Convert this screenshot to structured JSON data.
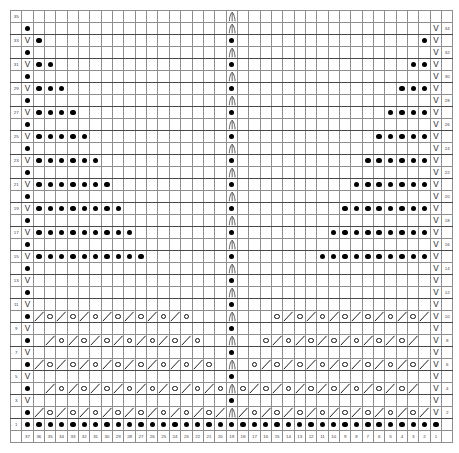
{
  "chart": {
    "kind": "knitting-stitch-chart",
    "columns": 37,
    "rows": 35,
    "cell_px": 11.35,
    "colors": {
      "grid_line": "#8e8e8e",
      "major_line": "#4a4a4a",
      "label_bg": "#dcdcdc",
      "no_stitch_bg": "#d2d2d2",
      "cell_bg": "#ffffff",
      "symbol": "#000000"
    },
    "symbols": {
      "purl": "●",
      "slip": "V",
      "yarnover": "O",
      "decrease": "╱",
      "double_decrease": "∧"
    },
    "column_numbers": [
      37,
      36,
      35,
      34,
      33,
      32,
      31,
      30,
      29,
      28,
      27,
      26,
      25,
      24,
      23,
      22,
      21,
      20,
      19,
      18,
      17,
      16,
      15,
      14,
      13,
      12,
      11,
      10,
      9,
      8,
      7,
      6,
      5,
      4,
      3,
      2,
      1
    ],
    "left_row_numbers": [
      35,
      "",
      33,
      "",
      31,
      "",
      29,
      "",
      27,
      "",
      25,
      "",
      23,
      "",
      21,
      "",
      19,
      "",
      17,
      "",
      15,
      "",
      13,
      "",
      11,
      "",
      9,
      "",
      7,
      "",
      5,
      "",
      3,
      "",
      1
    ],
    "right_row_numbers": [
      "",
      34,
      "",
      32,
      "",
      30,
      "",
      28,
      "",
      26,
      "",
      24,
      "",
      22,
      "",
      20,
      "",
      18,
      "",
      16,
      "",
      14,
      "",
      12,
      "",
      10,
      "",
      8,
      "",
      6,
      "",
      4,
      "",
      2,
      ""
    ],
    "center_column": 19,
    "rows_data": [
      {
        "n": 35,
        "left": "35",
        "right": "",
        "cells": "..................A..................",
        "ns_left": 0,
        "ns_right": 0
      },
      {
        "n": 34,
        "left": "",
        "right": "34",
        "cells": "_P................A................V_",
        "ns_left": 0,
        "ns_right": 0
      },
      {
        "n": 33,
        "left": "33",
        "right": "",
        "cells": "_VP...............P...............PV_",
        "ns_left": 0,
        "ns_right": 0
      },
      {
        "n": 32,
        "left": "",
        "right": "32",
        "cells": "_P................A................V_",
        "ns_left": 0,
        "ns_right": 0
      },
      {
        "n": 31,
        "left": "31",
        "right": "",
        "cells": "_VPP..............P..............PPV_",
        "ns_left": 0,
        "ns_right": 0
      },
      {
        "n": 30,
        "left": "",
        "right": "30",
        "cells": "_P................A................V_",
        "ns_left": 0,
        "ns_right": 0
      },
      {
        "n": 29,
        "left": "29",
        "right": "",
        "cells": "_VPPP.............P.............PPPV_",
        "ns_left": 0,
        "ns_right": 0
      },
      {
        "n": 28,
        "left": "",
        "right": "28",
        "cells": "_P................A................V_",
        "ns_left": 0,
        "ns_right": 0
      },
      {
        "n": 27,
        "left": "27",
        "right": "",
        "cells": "_VPPPP............P............PPPPV_",
        "ns_left": 0,
        "ns_right": 0
      },
      {
        "n": 26,
        "left": "",
        "right": "26",
        "cells": "_P................A................V_",
        "ns_left": 0,
        "ns_right": 0
      },
      {
        "n": 25,
        "left": "25",
        "right": "",
        "cells": "_VPPPPP...........P...........PPPPPV_",
        "ns_left": 0,
        "ns_right": 0
      },
      {
        "n": 24,
        "left": "",
        "right": "24",
        "cells": "_P................A................V_",
        "ns_left": 0,
        "ns_right": 0
      },
      {
        "n": 23,
        "left": "23",
        "right": "",
        "cells": "_VPPPPPP..........P..........PPPPPPV_",
        "ns_left": 0,
        "ns_right": 0
      },
      {
        "n": 22,
        "left": "",
        "right": "22",
        "cells": "_P................A................V_",
        "ns_left": 0,
        "ns_right": 0
      },
      {
        "n": 21,
        "left": "21",
        "right": "",
        "cells": "_VPPPPPPP.........P.........PPPPPPPV_",
        "ns_left": 0,
        "ns_right": 0
      },
      {
        "n": 20,
        "left": "",
        "right": "20",
        "cells": "_P................A................V_",
        "ns_left": 0,
        "ns_right": 0
      },
      {
        "n": 19,
        "left": "19",
        "right": "",
        "cells": "_VPPPPPPPP........P........PPPPPPPPV_",
        "ns_left": 0,
        "ns_right": 0
      },
      {
        "n": 18,
        "left": "",
        "right": "18",
        "cells": "_P................A................V_",
        "ns_left": 0,
        "ns_right": 0
      },
      {
        "n": 17,
        "left": "17",
        "right": "",
        "cells": "_VPPPPPPPPP.......P.......PPPPPPPPPV_",
        "ns_left": 0,
        "ns_right": 0
      },
      {
        "n": 16,
        "left": "",
        "right": "16",
        "cells": "_P................A................V_",
        "ns_left": 0,
        "ns_right": 0
      },
      {
        "n": 15,
        "left": "15",
        "right": "",
        "cells": "_VPPPPPPPPPP......P......PPPPPPPPPPV_",
        "ns_left": 0,
        "ns_right": 0
      },
      {
        "n": 14,
        "left": "",
        "right": "14",
        "cells": "_P................A................V_",
        "ns_left": 0,
        "ns_right": 0
      },
      {
        "n": 13,
        "left": "13",
        "right": "",
        "cells": "_V................P................V_",
        "ns_left": 0,
        "ns_right": 0
      },
      {
        "n": 12,
        "left": "",
        "right": "12",
        "cells": "_P................A................V_",
        "ns_left": 0,
        "ns_right": 0
      },
      {
        "n": 11,
        "left": "11",
        "right": "",
        "cells": "_V................P................V_",
        "ns_left": 0,
        "ns_right": 0
      },
      {
        "n": 10,
        "left": "",
        "right": "10",
        "cells": "_P/O/O/O/O/O/O____A____O/O/O/O/O/O/V_",
        "ns_left": 0,
        "ns_right": 0
      },
      {
        "n": 9,
        "left": "9",
        "right": "",
        "cells": "_V................P................V_",
        "ns_left": 0,
        "ns_right": 0
      },
      {
        "n": 8,
        "left": "",
        "right": "8",
        "cells": "_P./O/O/O/O/O/O___A___O/O/O/O/O/O/.V_",
        "ns_left": 0,
        "ns_right": 0
      },
      {
        "n": 7,
        "left": "7",
        "right": "",
        "cells": "_V................P................V_",
        "ns_left": 0,
        "ns_right": 0
      },
      {
        "n": 6,
        "left": "",
        "right": "6",
        "cells": "_P/O/O/O/O/O/O/O__A__O/O/O/O/O/O/O/V_",
        "ns_left": 0,
        "ns_right": 0
      },
      {
        "n": 5,
        "left": "5",
        "right": "",
        "cells": "_V................P................V_",
        "ns_left": 0,
        "ns_right": 0
      },
      {
        "n": 4,
        "left": "",
        "right": "4",
        "cells": "_P./O/O/O/O/O/O/O_A_O/O/O/O/O/O/O/.V_",
        "ns_left": 0,
        "ns_right": 0
      },
      {
        "n": 3,
        "left": "3",
        "right": "",
        "cells": "_V................P................V_",
        "ns_left": 0,
        "ns_right": 0
      },
      {
        "n": 2,
        "left": "",
        "right": "2",
        "cells": "_P/O/O/O/O/O/O/O/OA O/O/O/O/O/O/O/O/V_",
        "ns_left": 0,
        "ns_right": 0
      },
      {
        "n": 1,
        "left": "1",
        "right": "",
        "cells": "_PPPPPPPPPPPPPPPPPPPPPPPPPPPPPPPPPPP_",
        "ns_left": 0,
        "ns_right": 0
      }
    ]
  }
}
